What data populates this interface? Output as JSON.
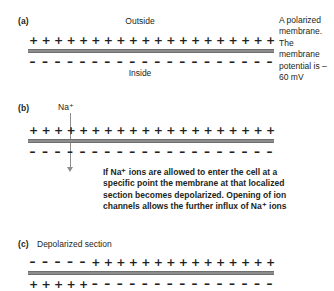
{
  "figure": {
    "panels": [
      {
        "id": "a",
        "label": "(a)",
        "top_label": "Outside",
        "bottom_label": "Inside",
        "outer_charges": "++++++++++++++++++++",
        "inner_charges": "--------------------",
        "side_caption": "A polarized membrane. The membrane potential is –60 mV"
      },
      {
        "id": "b",
        "label": "(b)",
        "ion_label": "Na⁺",
        "outer_charges": "++++++++++++++++++++",
        "inner_charges": "--------------------",
        "body_text": "If Na⁺ ions are allowed to enter the cell at a specific point the membrane at that localized section becomes depolarized. Opening of ion channels allows the further influx of Na⁺ ions"
      },
      {
        "id": "c",
        "label": "(c)",
        "section_label": "Depolarized section",
        "outer_charges": "-----+++++++++++++++",
        "inner_charges": "+++++---------------"
      }
    ],
    "charges": {
      "plus": "+",
      "minus": "–"
    },
    "colors": {
      "membrane": "#8d8d8d",
      "text": "#231f20",
      "background": "#ffffff"
    }
  }
}
